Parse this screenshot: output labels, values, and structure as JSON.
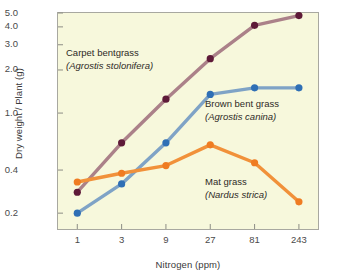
{
  "figure": {
    "background": "#ffffff",
    "plot_background": "#f7f8dc",
    "frame_color": "#a8a8a0"
  },
  "axes": {
    "y_title": "Dry weight / Plant (g)",
    "x_title": "Nitrogen (ppm)",
    "y_ticks": [
      "5.0",
      "4.0",
      "3.0",
      "2.0",
      "1.0",
      "0.4",
      "0.2"
    ],
    "x_ticks": [
      "1",
      "3",
      "9",
      "27",
      "81",
      "243"
    ]
  },
  "annotations": {
    "carpet": {
      "common": "Carpet bentgrass",
      "scientific": "(Agrostis stolonifera)"
    },
    "brown": {
      "common": "Brown bent grass",
      "scientific": "(Agrostis canina)"
    },
    "mat": {
      "common": "Mat grass",
      "scientific": "(Nardus strica)"
    }
  },
  "chart_data": {
    "type": "line",
    "title": "",
    "xlabel": "Nitrogen (ppm)",
    "ylabel": "Dry weight / Plant (g)",
    "xscale": "log",
    "yscale": "log",
    "x": [
      1,
      3,
      9,
      27,
      81,
      243
    ],
    "xlim": [
      0.62,
      390
    ],
    "ylim": [
      0.155,
      5.0
    ],
    "y_tick_values": [
      5.0,
      4.0,
      3.0,
      2.0,
      1.0,
      0.4,
      0.2
    ],
    "x_tick_values": [
      1,
      3,
      9,
      27,
      81,
      243
    ],
    "grid": false,
    "legend": "inline-annotations",
    "series": [
      {
        "name": "Carpet bentgrass",
        "scientific_name": "Agrostis stolonifera",
        "color": "#5e1a38",
        "line_color": "#ab8189",
        "values": [
          0.28,
          0.62,
          1.25,
          2.4,
          4.1,
          4.8
        ]
      },
      {
        "name": "Brown bent grass",
        "scientific_name": "Agrostis canina",
        "color": "#2f6fb5",
        "line_color": "#7fa3c6",
        "values": [
          0.2,
          0.32,
          0.62,
          1.35,
          1.5,
          1.5
        ]
      },
      {
        "name": "Mat grass",
        "scientific_name": "Nardus strica",
        "color": "#ef7c22",
        "line_color": "#f1913a",
        "values": [
          0.33,
          0.38,
          0.43,
          0.6,
          0.45,
          0.24
        ]
      }
    ]
  }
}
